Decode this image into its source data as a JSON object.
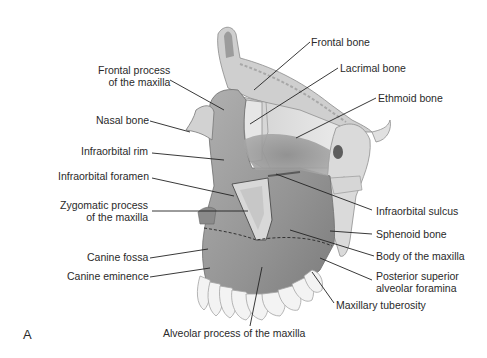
{
  "figure": {
    "panel_letter": "A",
    "background": "#ffffff",
    "colors": {
      "maxilla": "#9a9a9a",
      "maxilla_dark": "#7f7f7f",
      "bone_light": "#dcdcdc",
      "bone_mid": "#c4c4c4",
      "teeth": "#f2f2f2",
      "leader_line": "#222222"
    },
    "labels_left": {
      "frontal_process_line1": "Frontal process",
      "frontal_process_line2": "of the maxilla",
      "nasal_bone": "Nasal bone",
      "infraorbital_rim": "Infraorbital rim",
      "infraorbital_foramen": "Infraorbital foramen",
      "zygomatic_process_line1": "Zygomatic process",
      "zygomatic_process_line2": "of the maxilla",
      "canine_fossa": "Canine fossa",
      "canine_eminence": "Canine eminence"
    },
    "labels_right": {
      "frontal_bone": "Frontal bone",
      "lacrimal_bone": "Lacrimal bone",
      "ethmoid_bone": "Ethmoid bone",
      "infraorbital_sulcus": "Infraorbital sulcus",
      "sphenoid_bone": "Sphenoid bone",
      "body_of_maxilla": "Body of the maxilla",
      "posterior_superior_line1": "Posterior superior",
      "posterior_superior_line2": "alveolar foramina",
      "maxillary_tuberosity": "Maxillary tuberosity"
    },
    "labels_bottom": {
      "alveolar_process": "Alveolar process of the maxilla"
    }
  }
}
